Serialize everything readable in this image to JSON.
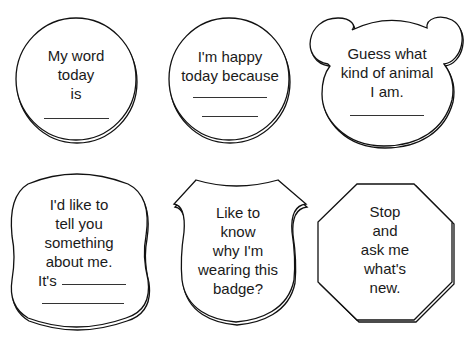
{
  "badges": [
    {
      "shape": "circle",
      "lines": [
        "My word",
        "today",
        "is"
      ],
      "blanks": 1
    },
    {
      "shape": "circle",
      "lines": [
        "I'm happy",
        "today because"
      ],
      "blanks": 2
    },
    {
      "shape": "bear-head",
      "lines": [
        "Guess what",
        "kind of animal",
        "I am."
      ],
      "blanks": 1
    },
    {
      "shape": "cloud-square",
      "lines": [
        "I'd like to",
        "tell you",
        "something",
        "about me."
      ],
      "prefix": "It's",
      "blanks": 2
    },
    {
      "shape": "shield",
      "lines": [
        "Like to",
        "know",
        "why I'm",
        "wearing this",
        "badge?"
      ],
      "blanks": 0
    },
    {
      "shape": "octagon",
      "lines": [
        "Stop",
        "and",
        "ask me",
        "what's",
        "new."
      ],
      "blanks": 0
    }
  ],
  "colors": {
    "stroke": "#111111",
    "background": "#ffffff",
    "text": "#1a1a1a"
  }
}
